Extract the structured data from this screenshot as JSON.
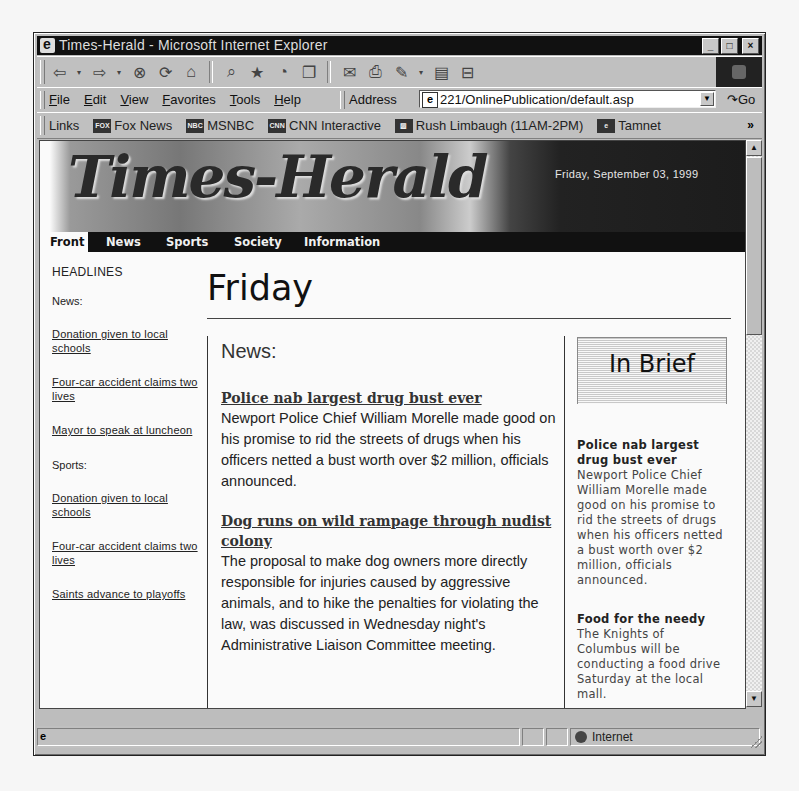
{
  "window": {
    "title": "Times-Herald - Microsoft Internet Explorer",
    "buttons": {
      "minimize": "_",
      "maximize": "□",
      "close": "×"
    }
  },
  "toolbar": {
    "buttons": [
      {
        "name": "back",
        "glyph": "⇦"
      },
      {
        "name": "back-dropdown",
        "glyph": "▾"
      },
      {
        "name": "forward",
        "glyph": "⇨"
      },
      {
        "name": "forward-dropdown",
        "glyph": "▾"
      },
      {
        "name": "stop",
        "glyph": "⊗"
      },
      {
        "name": "refresh",
        "glyph": "⟳"
      },
      {
        "name": "home",
        "glyph": "⌂"
      },
      {
        "name": "search",
        "glyph": "⌕"
      },
      {
        "name": "favorites",
        "glyph": "★"
      },
      {
        "name": "history",
        "glyph": "◔"
      },
      {
        "name": "channels",
        "glyph": "❐"
      },
      {
        "name": "mail",
        "glyph": "✉"
      },
      {
        "name": "print",
        "glyph": "⎙"
      },
      {
        "name": "edit",
        "glyph": "✎"
      },
      {
        "name": "edit-dropdown",
        "glyph": "▾"
      },
      {
        "name": "discuss",
        "glyph": "▤"
      },
      {
        "name": "messenger",
        "glyph": "⊟"
      }
    ]
  },
  "menu": {
    "items": [
      "File",
      "Edit",
      "View",
      "Favorites",
      "Tools",
      "Help"
    ]
  },
  "address": {
    "label": "Address",
    "value": "221/OnlinePublication/default.asp",
    "go_label": "Go"
  },
  "links": {
    "label": "Links",
    "items": [
      {
        "label": "Fox News",
        "icon": "FOX"
      },
      {
        "label": "MSNBC",
        "icon": "NBC"
      },
      {
        "label": "CNN Interactive",
        "icon": "CNN"
      },
      {
        "label": "Rush Limbaugh (11AM-2PM)",
        "icon": "▨"
      },
      {
        "label": "Tamnet",
        "icon": "e"
      }
    ],
    "more": "»"
  },
  "page": {
    "masthead": "Times-Herald",
    "date": "Friday, September 03, 1999",
    "nav": [
      "Front",
      "News",
      "Sports",
      "Society",
      "Information"
    ],
    "sidebar": {
      "header": "HEADLINES",
      "news_label": "News:",
      "news_links": [
        "Donation given to local schools",
        "Four-car accident claims two lives",
        "Mayor to speak at luncheon"
      ],
      "sports_label": "Sports:",
      "sports_links": [
        "Donation given to local schools",
        "Four-car accident claims two lives",
        "Saints advance to playoffs"
      ]
    },
    "title": "Friday",
    "main": {
      "section": "News:",
      "stories": [
        {
          "headline": "Police nab largest drug bust ever",
          "body": "Newport Police Chief William Morelle made good on his promise to rid the streets of drugs when his officers netted a bust worth over $2 million, officials announced."
        },
        {
          "headline": "Dog runs on wild rampage through nudist colony",
          "body": "The proposal to make dog owners more directly responsible for injuries caused by aggressive animals, and to hike the penalties for violating the law, was discussed in Wednesday night's Administrative Liaison Committee meeting."
        }
      ]
    },
    "brief": {
      "title": "In Brief",
      "items": [
        {
          "headline": "Police nab largest drug bust ever",
          "body": "Newport Police Chief William Morelle made good on his promise to rid the streets of drugs when his officers netted a bust worth over $2 million, officials announced."
        },
        {
          "headline": "Food for the needy",
          "body": "The Knights of Columbus will be conducting a food drive Saturday at the local mall."
        }
      ]
    }
  },
  "scrollbar": {
    "up": "▲",
    "down": "▼"
  },
  "status": {
    "page_icon": "e",
    "zone": "Internet"
  }
}
